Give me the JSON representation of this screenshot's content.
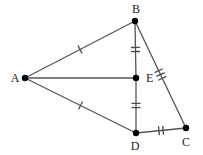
{
  "figure": {
    "width": 203,
    "height": 155,
    "background": "#ffffff",
    "line_color": "#555555",
    "tick_color": "#4a4a4a",
    "point_color": "#000000",
    "label_color": "#1a1a1a",
    "line_width": 1.3,
    "point_radius": 3.2,
    "label_font_size": 12
  },
  "points": [
    {
      "id": "A",
      "label": "A",
      "x": 25,
      "y": 78,
      "label_x": 15,
      "label_y": 82,
      "anchor": "middle"
    },
    {
      "id": "B",
      "label": "B",
      "x": 135,
      "y": 21,
      "label_x": 136,
      "label_y": 13,
      "anchor": "middle"
    },
    {
      "id": "C",
      "label": "C",
      "x": 186,
      "y": 128,
      "label_x": 186,
      "label_y": 146,
      "anchor": "middle"
    },
    {
      "id": "D",
      "label": "D",
      "x": 136,
      "y": 133,
      "label_x": 135,
      "label_y": 150,
      "anchor": "middle"
    },
    {
      "id": "E",
      "label": "E",
      "x": 136,
      "y": 78,
      "label_x": 146,
      "label_y": 82,
      "anchor": "start"
    }
  ],
  "segments": [
    {
      "id": "AB",
      "from": "A",
      "to": "B",
      "x1": 25,
      "y1": 78,
      "x2": 135,
      "y2": 21,
      "ticks": 1
    },
    {
      "id": "AE",
      "from": "A",
      "to": "E",
      "x1": 25,
      "y1": 78,
      "x2": 136,
      "y2": 78,
      "ticks": 0
    },
    {
      "id": "AD",
      "from": "A",
      "to": "D",
      "x1": 25,
      "y1": 78,
      "x2": 136,
      "y2": 133,
      "ticks": 1
    },
    {
      "id": "BE",
      "from": "B",
      "to": "E",
      "x1": 135,
      "y1": 21,
      "x2": 136,
      "y2": 78,
      "ticks": 2
    },
    {
      "id": "ED",
      "from": "E",
      "to": "D",
      "x1": 136,
      "y1": 78,
      "x2": 136,
      "y2": 133,
      "ticks": 2
    },
    {
      "id": "BC",
      "from": "B",
      "to": "C",
      "x1": 135,
      "y1": 21,
      "x2": 186,
      "y2": 128,
      "ticks": 3
    },
    {
      "id": "DC",
      "from": "D",
      "to": "C",
      "x1": 136,
      "y1": 133,
      "x2": 186,
      "y2": 128,
      "ticks": 2
    }
  ],
  "tick_style": {
    "length": 9,
    "spacing": 4.2,
    "width": 1.3
  }
}
